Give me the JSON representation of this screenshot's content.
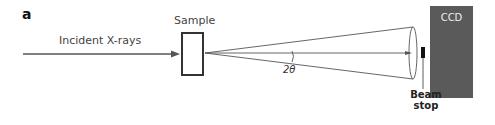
{
  "panel_label": "a",
  "labels": {
    "incident": "Incident X-rays",
    "sample": "Sample",
    "angle": "2θ",
    "ccd": "CCD",
    "beam_stop_line1": "Beam",
    "beam_stop_line2": "stop"
  },
  "colors": {
    "line": "#555555",
    "ccd_fill": "#5a5a5a",
    "beam_stop": "#111111"
  }
}
